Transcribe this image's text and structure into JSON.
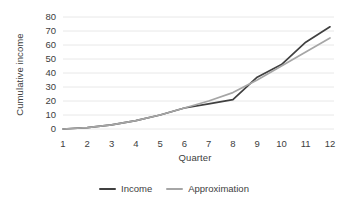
{
  "chart_data": {
    "type": "line",
    "title": "",
    "xlabel": "Quarter",
    "ylabel": "Cumulative income",
    "categories": [
      "1",
      "2",
      "3",
      "4",
      "5",
      "6",
      "7",
      "8",
      "9",
      "10",
      "11",
      "12"
    ],
    "x": [
      1,
      2,
      3,
      4,
      5,
      6,
      7,
      8,
      9,
      10,
      11,
      12
    ],
    "xlim": [
      1,
      12
    ],
    "ylim": [
      0,
      80
    ],
    "yticks": [
      0,
      10,
      20,
      30,
      40,
      50,
      60,
      70,
      80
    ],
    "ytick_labels": [
      "0",
      "10",
      "20",
      "30",
      "40",
      "50",
      "60",
      "70",
      "80"
    ],
    "grid": "horizontal",
    "legend_position": "bottom-center",
    "series": [
      {
        "name": "Income",
        "color": "#404040",
        "values": [
          0,
          1,
          3,
          6,
          10,
          15,
          18,
          21,
          37,
          46,
          62,
          73
        ]
      },
      {
        "name": "Approximation",
        "color": "#a6a6a6",
        "values": [
          0,
          1,
          3,
          6,
          10,
          15,
          20,
          26,
          35,
          45,
          55,
          65
        ]
      }
    ]
  },
  "legend": {
    "entries": [
      {
        "label": "Income",
        "color": "#404040"
      },
      {
        "label": "Approximation",
        "color": "#a6a6a6"
      }
    ]
  },
  "colors": {
    "income": "#404040",
    "approximation": "#a6a6a6",
    "gridline": "#e8e8e8",
    "text": "#404040",
    "background": "#ffffff"
  }
}
